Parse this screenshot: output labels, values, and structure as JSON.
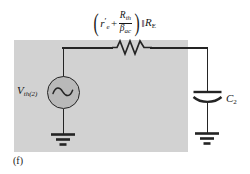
{
  "figure": {
    "caption": "(f)",
    "panel_color": "#d2d2d2",
    "wire_color": "#242424",
    "text_color": "#151515"
  },
  "impedance_label": {
    "open_paren": "(",
    "close_paren": ")",
    "term1_base": "r",
    "term1_prime": "′",
    "term1_sub": "e",
    "plus": "+",
    "fraction_numerator_base": "R",
    "fraction_numerator_sub": "th",
    "fraction_denominator_base": "β",
    "fraction_denominator_sub": "ac",
    "parallel_symbol": "‖",
    "term2_base": "R",
    "term2_sub": "E",
    "plain_text": "(r′e + Rth/βac) ‖ RE"
  },
  "source": {
    "label_base": "V",
    "label_sub": "th(2)",
    "icon": "sine-wave-icon",
    "plain_text": "Vth(2)"
  },
  "capacitor": {
    "label_base": "C",
    "label_sub": "2",
    "plain_text": "C2"
  },
  "components": {
    "resistor_name": "resistor-symbol",
    "ground_left_name": "ground-symbol-left",
    "ground_right_name": "ground-symbol-right"
  }
}
